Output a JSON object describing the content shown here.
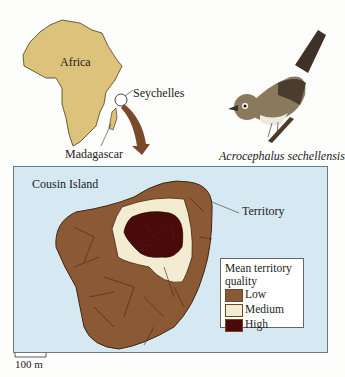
{
  "map_top": {
    "continent_label": "Africa",
    "islands_label": "Seychelles",
    "madagascar_label": "Madagascar",
    "continent_color": "#dcc27a"
  },
  "bird": {
    "species_label": "Acrocephalus sechellensis"
  },
  "island_map": {
    "title": "Cousin Island",
    "territory_label": "Territory",
    "sea_color": "#d6e9f2",
    "scale_label": "100 m"
  },
  "legend": {
    "title_line1": "Mean territory",
    "title_line2": "quality",
    "items": [
      {
        "label": "Low",
        "color": "#8b5a35"
      },
      {
        "label": "Medium",
        "color": "#f3ecd0"
      },
      {
        "label": "High",
        "color": "#4a0a0a"
      }
    ]
  }
}
